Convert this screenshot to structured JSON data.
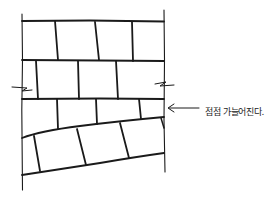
{
  "diagram": {
    "annotation": "점점 가늘어진다.",
    "colors": {
      "stroke": "#1a1a1a",
      "background": "#ffffff"
    }
  }
}
